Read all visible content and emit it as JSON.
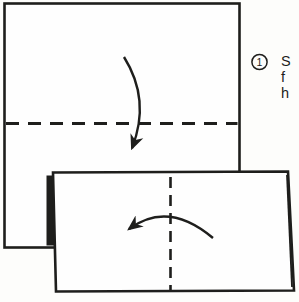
{
  "colors": {
    "background": "#fdfdfb",
    "ink": "#1e1e1c",
    "paper": "#fefefe"
  },
  "step": {
    "number": "1",
    "instruction_lines": [
      "S",
      "f",
      "h"
    ]
  },
  "icons": {
    "fold_down_arrow": "curved-arrow-down",
    "fold_left_arrow": "curved-arrow-left"
  },
  "diagram": {
    "description_elements": {
      "unfolded_square": "square sheet of paper",
      "horizontal_fold_line": "dashed valley fold line",
      "folded_rectangle": "paper folded in half downward",
      "vertical_crease_line": "dashed center crease",
      "paper_edge_shadow": "dark folded edge"
    }
  }
}
